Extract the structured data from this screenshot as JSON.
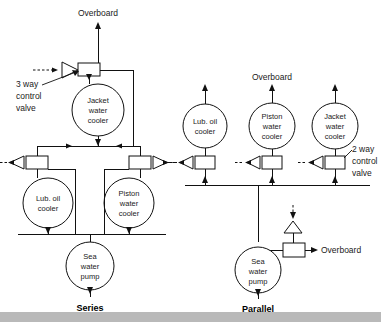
{
  "diagram": {
    "colors": {
      "line": "#111111",
      "text": "#1a1a1a",
      "background": "#ffffff",
      "footer_bar": "#b9b9b9"
    },
    "series": {
      "section_label": "Series",
      "overboard_label": "Overboard",
      "valve_label_line1": "3 way",
      "valve_label_line2": "control",
      "valve_label_line3": "valve",
      "coolers": [
        {
          "line1": "Jacket",
          "line2": "water",
          "line3": "cooler"
        },
        {
          "line1": "Lub. oil",
          "line2": "cooler",
          "line3": ""
        },
        {
          "line1": "Piston",
          "line2": "water",
          "line3": "cooler"
        }
      ],
      "pump": {
        "line1": "Sea",
        "line2": "water",
        "line3": "pump"
      }
    },
    "parallel": {
      "section_label": "Parallel",
      "overboard_label_top": "Overboard",
      "overboard_label_right": "Overboard",
      "valve_label_line1": "2 way",
      "valve_label_line2": "control",
      "valve_label_line3": "valve",
      "coolers": [
        {
          "line1": "Lub. oil",
          "line2": "cooler",
          "line3": ""
        },
        {
          "line1": "Piston",
          "line2": "water",
          "line3": "cooler"
        },
        {
          "line1": "Jacket",
          "line2": "water",
          "line3": "cooler"
        }
      ],
      "pump": {
        "line1": "Sea",
        "line2": "water",
        "line3": "pump"
      }
    }
  }
}
